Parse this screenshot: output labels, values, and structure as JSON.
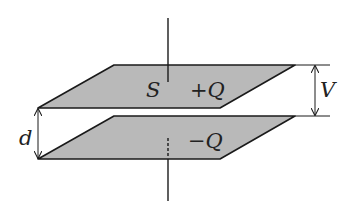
{
  "diagram": {
    "type": "parallel-plate-capacitor",
    "colors": {
      "plate_fill": "#b9b9b9",
      "stroke": "#1a1a1a",
      "background": "#ffffff"
    },
    "labels": {
      "area": "S",
      "top_charge": "+Q",
      "bottom_charge": "−Q",
      "voltage": "V",
      "separation": "d"
    },
    "plates": [
      {
        "name": "top-plate",
        "points": "114,65 295,65 220,108 38,108"
      },
      {
        "name": "bottom-plate",
        "points": "114,116 295,116 220,159 38,159"
      }
    ]
  }
}
